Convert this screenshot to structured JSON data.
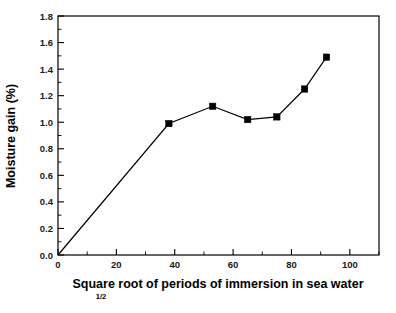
{
  "chart_data": {
    "type": "line",
    "title": "",
    "xlabel": "Square root of periods of immersion in sea water",
    "xlabel_superscript": "1/2",
    "ylabel": "Moisture gain (%)",
    "xlim": [
      0,
      110
    ],
    "ylim": [
      0.0,
      1.8
    ],
    "grid": false,
    "legend": "none",
    "marker": "filled-square",
    "line_color": "#000000",
    "marker_color": "#000000",
    "x_ticks": [
      0,
      20,
      40,
      60,
      80,
      100
    ],
    "x_tick_labels": [
      "0",
      "20",
      "40",
      "60",
      "80",
      "100"
    ],
    "x_minor_tick_interval": 10,
    "y_ticks": [
      0.0,
      0.2,
      0.4,
      0.6,
      0.8,
      1.0,
      1.2,
      1.4,
      1.6,
      1.8
    ],
    "y_tick_labels": [
      "0.0",
      "0.2",
      "0.4",
      "0.6",
      "0.8",
      "1.0",
      "1.2",
      "1.4",
      "1.6",
      "1.8"
    ],
    "y_minor_tick_interval": 0.1,
    "series": [
      {
        "name": "Moisture gain",
        "x": [
          0,
          38,
          53,
          65,
          75,
          84.5,
          92
        ],
        "y": [
          0.0,
          0.99,
          1.12,
          1.02,
          1.04,
          1.25,
          1.49
        ]
      }
    ]
  },
  "figure": {
    "background_color": "#ffffff",
    "axis_color": "#000000"
  }
}
